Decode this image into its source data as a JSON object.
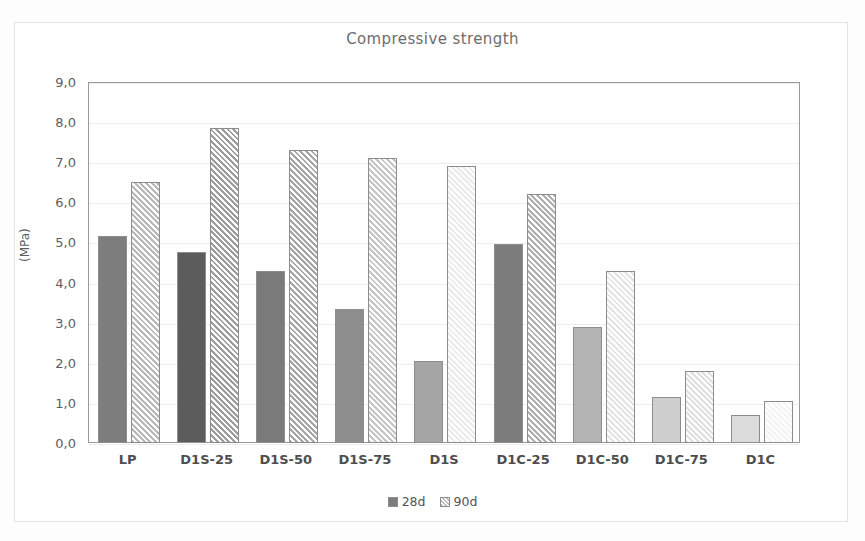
{
  "chart_data": {
    "type": "bar",
    "title": "Compressive strength",
    "xlabel": "",
    "ylabel": "(MPa)",
    "ylim": [
      0,
      9
    ],
    "ytick_step": 1,
    "ytick_labels": [
      "0,0",
      "1,0",
      "2,0",
      "3,0",
      "4,0",
      "5,0",
      "6,0",
      "7,0",
      "8,0",
      "9,0"
    ],
    "grid": true,
    "legend_position": "bottom-center",
    "categories": [
      "LP",
      "D1S-25",
      "D1S-50",
      "D1S-75",
      "D1S",
      "D1C-25",
      "D1C-50",
      "D1C-75",
      "D1C"
    ],
    "series": [
      {
        "name": "28d",
        "values": [
          5.15,
          4.75,
          4.3,
          3.35,
          2.05,
          4.95,
          2.9,
          1.15,
          0.7
        ],
        "colors": [
          "#7d7d7d",
          "#5c5c5c",
          "#7a7a7a",
          "#8e8e8e",
          "#a5a5a5",
          "#7c7c7c",
          "#b4b4b4",
          "#cfcfcf",
          "#dcdcdc"
        ]
      },
      {
        "name": "90d",
        "values": [
          6.5,
          7.85,
          7.3,
          7.1,
          6.9,
          6.2,
          4.3,
          1.8,
          1.05
        ],
        "colors": [
          "#b9b9b9",
          "#9d9d9d",
          "#a6a6a6",
          "#c6c6c6",
          "#ebebeb",
          "#b0b0b0",
          "#e4e4e4",
          "#e0e0e0",
          "#f4f4f4"
        ]
      }
    ]
  },
  "legend": {
    "items": [
      {
        "label": "28d"
      },
      {
        "label": "90d"
      }
    ]
  },
  "colors": {
    "plot_border": "#9a9a9a",
    "gridline": "#ededed",
    "text": "#4a4a4a",
    "background": "#ffffff"
  }
}
